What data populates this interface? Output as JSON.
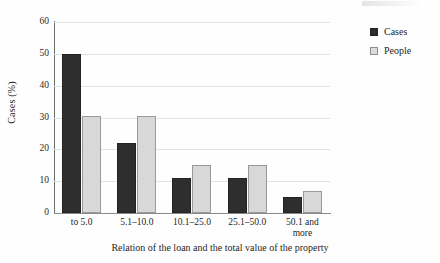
{
  "chart_data": {
    "type": "bar",
    "title": "",
    "xlabel": "Relation of the loan and the total value of the property",
    "ylabel": "Cases (%)",
    "categories": [
      "to 5.0",
      "5.1–10.0",
      "10.1–25.0",
      "25.1–50.0",
      "50.1 and\nmore"
    ],
    "series": [
      {
        "name": "Cases",
        "color": "#2e2e2e",
        "values": [
          50,
          22,
          11,
          11,
          5
        ]
      },
      {
        "name": "People",
        "color": "#d8d8d8",
        "values": [
          30.5,
          30.5,
          15,
          15,
          7
        ]
      }
    ],
    "ylim": [
      0,
      60
    ],
    "yticks": [
      0,
      10,
      20,
      30,
      40,
      50,
      60
    ],
    "ytick_labels": [
      "0",
      "10",
      "20",
      "30",
      "40",
      "50",
      "60"
    ],
    "grid": true,
    "legend_position": "top-right"
  },
  "legend": {
    "items": [
      {
        "label": "Cases"
      },
      {
        "label": "People"
      }
    ]
  }
}
